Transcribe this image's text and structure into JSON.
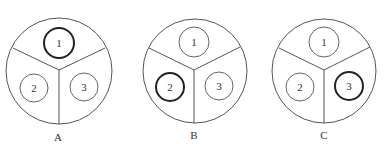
{
  "diagrams": [
    {
      "label": "A",
      "highlighted": "1",
      "cx": 59,
      "cy": 71,
      "r": 53,
      "inner": [
        {
          "label": "1",
          "cx": 59,
          "cy": 43,
          "r": 15,
          "bold": true
        },
        {
          "label": "2",
          "cx": 34,
          "cy": 88,
          "r": 14,
          "bold": false
        },
        {
          "label": "3",
          "cx": 84,
          "cy": 87,
          "r": 14,
          "bold": false
        }
      ]
    },
    {
      "label": "B",
      "highlighted": "2",
      "cx": 195,
      "cy": 71,
      "r": 52,
      "inner": [
        {
          "label": "1",
          "cx": 194,
          "cy": 42,
          "r": 15,
          "bold": false
        },
        {
          "label": "2",
          "cx": 170,
          "cy": 87,
          "r": 14,
          "bold": true
        },
        {
          "label": "3",
          "cx": 219,
          "cy": 86,
          "r": 14,
          "bold": false
        }
      ]
    },
    {
      "label": "C",
      "highlighted": "3",
      "cx": 324,
      "cy": 71,
      "r": 52,
      "inner": [
        {
          "label": "1",
          "cx": 324,
          "cy": 42,
          "r": 15,
          "bold": false
        },
        {
          "label": "2",
          "cx": 300,
          "cy": 87,
          "r": 14,
          "bold": false
        },
        {
          "label": "3",
          "cx": 349,
          "cy": 86,
          "r": 14,
          "bold": true
        }
      ]
    }
  ]
}
